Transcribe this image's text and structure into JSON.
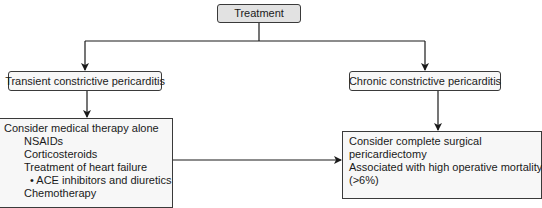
{
  "diagram": {
    "root": {
      "label": "Treatment"
    },
    "branches": [
      {
        "label": "Transient constrictive pericarditis",
        "content": {
          "heading": "Consider medical therapy alone",
          "items": [
            {
              "label": "NSAIDs",
              "level": 1
            },
            {
              "label": "Corticosteroids",
              "level": 1
            },
            {
              "label": "Treatment of heart failure",
              "level": 1
            },
            {
              "label": "• ACE inhibitors and diuretics",
              "level": 2
            },
            {
              "label": "Chemotherapy",
              "level": 1
            }
          ]
        }
      },
      {
        "label": "Chronic constrictive pericarditis",
        "content": {
          "lines": [
            "Consider complete surgical",
            "pericardiectomy",
            "Associated with high operative mortality",
            "(>6%)"
          ]
        }
      }
    ],
    "edges": [
      {
        "from": "Treatment",
        "to": "Transient constrictive pericarditis"
      },
      {
        "from": "Treatment",
        "to": "Chronic constrictive pericarditis"
      },
      {
        "from": "Transient constrictive pericarditis",
        "to": "Consider medical therapy alone"
      },
      {
        "from": "Chronic constrictive pericarditis",
        "to": "Consider complete surgical pericardiectomy"
      },
      {
        "from": "Consider medical therapy alone",
        "to": "Consider complete surgical pericardiectomy"
      }
    ],
    "colors": {
      "root_fill": "#e2e2e2",
      "box_fill": "#f7f7f7",
      "stroke": "#1a1a1a"
    }
  }
}
